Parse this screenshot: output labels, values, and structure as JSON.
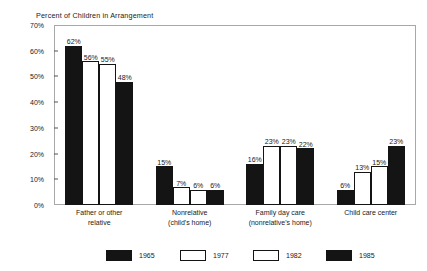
{
  "chart_data": {
    "type": "bar",
    "title": "Percent of Children in Arrangement",
    "xlabel": "",
    "ylabel": "",
    "ylim": [
      0,
      70
    ],
    "grid": false,
    "legend_position": "bottom",
    "y_ticks": [
      "0%",
      "10%",
      "20%",
      "30%",
      "40%",
      "50%",
      "60%",
      "70%"
    ],
    "y_tick_values": [
      0,
      10,
      20,
      30,
      40,
      50,
      60,
      70
    ],
    "categories": [
      "Father or other\nrelative",
      "Nonrelative\n(child's home)",
      "Family day care\n(nonrelative's home)",
      "Child care center"
    ],
    "series": [
      {
        "name": "1965",
        "style": "filled",
        "values": [
          62,
          15,
          16,
          6
        ],
        "labels": [
          "62%",
          "15%",
          "16%",
          "6%"
        ]
      },
      {
        "name": "1977",
        "style": "hollow",
        "values": [
          56,
          7,
          23,
          13
        ],
        "labels": [
          "56%",
          "7%",
          "23%",
          "13%"
        ]
      },
      {
        "name": "1982",
        "style": "hollow",
        "values": [
          55,
          6,
          23,
          15
        ],
        "labels": [
          "55%",
          "6%",
          "23%",
          "15%"
        ]
      },
      {
        "name": "1985",
        "style": "filled",
        "values": [
          48,
          6,
          22,
          23
        ],
        "labels": [
          "48%",
          "6%",
          "22%",
          "23%"
        ]
      }
    ]
  },
  "colors": {
    "filled": "#141414",
    "hollow": "#ffffff",
    "outline": "#141414",
    "frame": "#a8a8a8",
    "text": "#1a1a1a"
  }
}
